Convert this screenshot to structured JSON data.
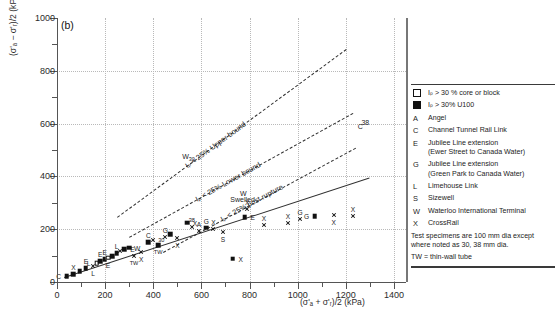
{
  "panel": {
    "label": "(b)"
  },
  "chart_data": {
    "type": "scatter",
    "title": "",
    "subtitle": "",
    "xlabel": "(σ'ₐ + σ'ᵣ)/2   (kPa)",
    "ylabel": "(σ'ₐ − σ'ᵣ)/2   (kPa)",
    "xlim": [
      0,
      1450
    ],
    "ylim": [
      0,
      1000
    ],
    "xticks_major": [
      0,
      200,
      400,
      600,
      800,
      1000,
      1200,
      1400
    ],
    "xticks_minor": [
      100,
      300,
      500,
      700,
      900,
      1100,
      1300
    ],
    "yticks_major": [
      0,
      200,
      400,
      600,
      800,
      1000
    ],
    "yticks_minor": [
      100,
      300,
      500,
      700,
      900
    ],
    "grid": "dotted-major-both",
    "legend_position": "right-outside",
    "trend_lines": [
      {
        "name": "Ip < 25% Upper bound",
        "style": "dashed",
        "label": "Iₚ < 25% Upper bound",
        "x0": 250,
        "y0": 245,
        "x1": 1200,
        "y1": 880
      },
      {
        "name": "Ip < 25% Lower bound",
        "style": "dashed",
        "label": "Iₚ < 25% Lower bound",
        "x0": 300,
        "y0": 170,
        "x1": 1230,
        "y1": 640
      },
      {
        "name": "Ip < 25% post rupture",
        "style": "dashed",
        "label": "Iₚ < 25% post rupture",
        "x0": 440,
        "y0": 115,
        "x1": 1240,
        "y1": 510
      },
      {
        "name": "best-fit solid line",
        "style": "solid",
        "label": "",
        "x0": 30,
        "y0": 18,
        "x1": 1300,
        "y1": 395
      }
    ],
    "annotations": [
      {
        "text": "W",
        "sub": "30",
        "x": 520,
        "y": 468
      },
      {
        "text": "W",
        "x": 760,
        "y": 330
      },
      {
        "text": "Swelled",
        "x": 720,
        "y": 305
      },
      {
        "text": "38",
        "x": 1265,
        "y": 600
      },
      {
        "text": "C",
        "x": 1250,
        "y": 585
      }
    ],
    "points": [
      {
        "x": 40,
        "y": 22,
        "marker": "filled",
        "label": "C",
        "lpos": "left"
      },
      {
        "x": 68,
        "y": 30,
        "marker": "filled",
        "label": "X",
        "lpos": "above"
      },
      {
        "x": 95,
        "y": 40,
        "marker": "filled",
        "label": "",
        "lpos": ""
      },
      {
        "x": 120,
        "y": 52,
        "marker": "filled",
        "label": "E",
        "lpos": "above"
      },
      {
        "x": 150,
        "y": 60,
        "marker": "cross",
        "label": "L",
        "lpos": "below"
      },
      {
        "x": 165,
        "y": 72,
        "marker": "open",
        "label": "L",
        "lpos": "left"
      },
      {
        "x": 180,
        "y": 78,
        "marker": "filled",
        "label": "E",
        "lpos": "above"
      },
      {
        "x": 198,
        "y": 86,
        "marker": "filled",
        "label": "E",
        "lpos": "above"
      },
      {
        "x": 212,
        "y": 92,
        "marker": "open",
        "label": "E",
        "lpos": "below"
      },
      {
        "x": 230,
        "y": 98,
        "marker": "filled",
        "label": "",
        "lpos": ""
      },
      {
        "x": 248,
        "y": 110,
        "marker": "filled",
        "label": "L",
        "lpos": "above"
      },
      {
        "x": 262,
        "y": 118,
        "marker": "cross",
        "label": "",
        "lpos": ""
      },
      {
        "x": 280,
        "y": 124,
        "marker": "filled",
        "label": "E",
        "lpos": "right"
      },
      {
        "x": 300,
        "y": 130,
        "marker": "filled",
        "label": "W",
        "lpos": "right"
      },
      {
        "x": 320,
        "y": 98,
        "marker": "cross",
        "label": "TW",
        "lpos": "below"
      },
      {
        "x": 350,
        "y": 112,
        "marker": "cross",
        "label": "X",
        "lpos": "below"
      },
      {
        "x": 380,
        "y": 150,
        "marker": "filled",
        "label": "C",
        "lpos": "above"
      },
      {
        "x": 400,
        "y": 158,
        "marker": "cross",
        "label": "30",
        "lpos": "right"
      },
      {
        "x": 420,
        "y": 140,
        "marker": "filled",
        "label": "TW",
        "lpos": "below"
      },
      {
        "x": 450,
        "y": 172,
        "marker": "cross",
        "label": "G",
        "lpos": "above"
      },
      {
        "x": 470,
        "y": 180,
        "marker": "filled",
        "label": "",
        "lpos": ""
      },
      {
        "x": 500,
        "y": 165,
        "marker": "cross",
        "label": "X",
        "lpos": "below"
      },
      {
        "x": 540,
        "y": 225,
        "marker": "filled",
        "label": "X",
        "lpos": "right"
      },
      {
        "x": 560,
        "y": 210,
        "marker": "cross",
        "label": "38",
        "lpos": "above"
      },
      {
        "x": 590,
        "y": 195,
        "marker": "cross",
        "label": "A",
        "lpos": "above"
      },
      {
        "x": 620,
        "y": 205,
        "marker": "filled",
        "label": "G",
        "lpos": "above"
      },
      {
        "x": 650,
        "y": 200,
        "marker": "cross",
        "label": "X",
        "lpos": "above"
      },
      {
        "x": 690,
        "y": 190,
        "marker": "cross",
        "label": "S",
        "lpos": "below"
      },
      {
        "x": 730,
        "y": 88,
        "marker": "filled",
        "label": "X",
        "lpos": "right"
      },
      {
        "x": 780,
        "y": 245,
        "marker": "filled",
        "label": "E",
        "lpos": "right"
      },
      {
        "x": 790,
        "y": 275,
        "marker": "cross",
        "label": "X",
        "lpos": "above"
      },
      {
        "x": 860,
        "y": 215,
        "marker": "cross",
        "label": "X",
        "lpos": "above"
      },
      {
        "x": 960,
        "y": 225,
        "marker": "cross",
        "label": "X",
        "lpos": "above"
      },
      {
        "x": 1010,
        "y": 240,
        "marker": "cross",
        "label": "G",
        "lpos": "above"
      },
      {
        "x": 1070,
        "y": 250,
        "marker": "filled",
        "label": "G",
        "lpos": "left"
      },
      {
        "x": 1150,
        "y": 252,
        "marker": "cross",
        "label": "X",
        "lpos": "below"
      },
      {
        "x": 1230,
        "y": 250,
        "marker": "cross",
        "label": "X",
        "lpos": "above"
      }
    ]
  },
  "legend": {
    "entries": [
      {
        "key": "swatch-open",
        "key_type": "square-open",
        "text": "Iₚ > 30 % core or block",
        "text2": ""
      },
      {
        "key": "swatch-filled",
        "key_type": "square-filled",
        "text": "Iₚ > 30% U100",
        "text2": ""
      },
      {
        "key": "A",
        "key_type": "letter",
        "text": "Angel",
        "text2": ""
      },
      {
        "key": "C",
        "key_type": "letter",
        "text": "Channel Tunnel Rail Link",
        "text2": ""
      },
      {
        "key": "E",
        "key_type": "letter",
        "text": "Jubilee Line extension",
        "text2": "(Ewer Street to Canada Water)"
      },
      {
        "key": "G",
        "key_type": "letter",
        "text": "Jubilee Line extension",
        "text2": "(Green Park to Canada Water)"
      },
      {
        "key": "L",
        "key_type": "letter",
        "text": "Limehouse Link",
        "text2": ""
      },
      {
        "key": "S",
        "key_type": "letter",
        "text": "Sizewell",
        "text2": ""
      },
      {
        "key": "W",
        "key_type": "letter",
        "text": "Waterloo International Terminal",
        "text2": ""
      },
      {
        "key": "X",
        "key_type": "letter",
        "text": "CrossRail",
        "text2": ""
      }
    ],
    "note_line1": "Test specimens are 100 mm dia except",
    "note_line2": "where noted as 30, 38 mm dia.",
    "tw_note": "TW = thin-wall tube"
  },
  "colors": {
    "axis": "#555555",
    "grid": "#b9b9b9",
    "marker": "#111111",
    "text": "#1c1c1c",
    "background": "#ffffff"
  }
}
